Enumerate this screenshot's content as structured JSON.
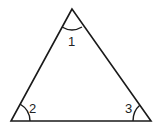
{
  "diagram": {
    "type": "triangle",
    "stroke_color": "#1a1a1a",
    "vertices": {
      "top": [
        72,
        9
      ],
      "bottom_left": [
        11,
        121
      ],
      "bottom_right": [
        151,
        121
      ]
    },
    "angles": [
      {
        "label": "1",
        "vertex": "top"
      },
      {
        "label": "2",
        "vertex": "bottom_left"
      },
      {
        "label": "3",
        "vertex": "bottom_right"
      }
    ]
  }
}
